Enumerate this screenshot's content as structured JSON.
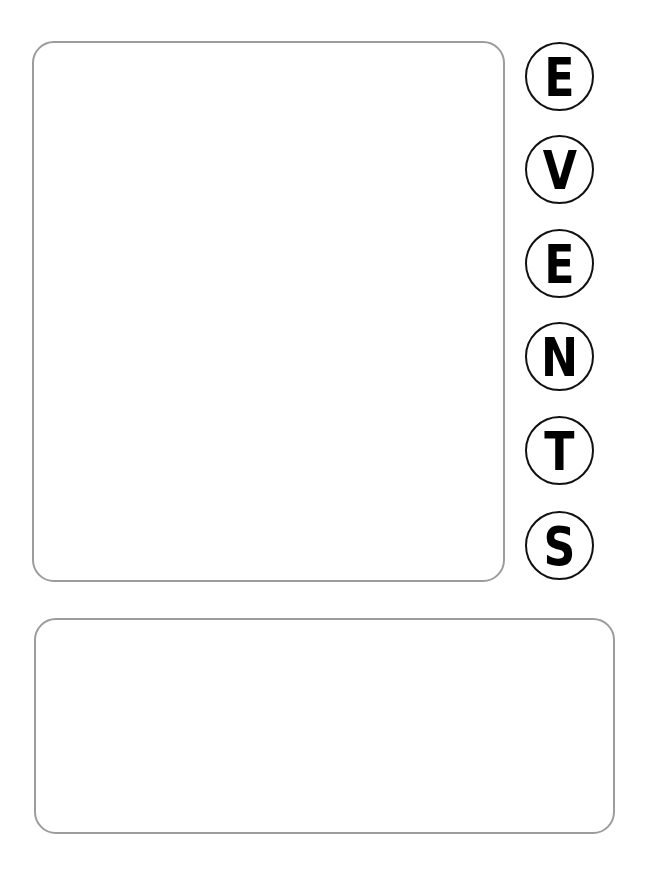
{
  "title_letters": [
    {
      "char": "E"
    },
    {
      "char": "V"
    },
    {
      "char": "E"
    },
    {
      "char": "N"
    },
    {
      "char": "T"
    },
    {
      "char": "S"
    }
  ],
  "title_word": "EVENTS",
  "panels": {
    "upper": {
      "content": ""
    },
    "lower": {
      "content": ""
    }
  },
  "colors": {
    "panel_border": "#9c9c9c",
    "circle_border": "#111111",
    "letter": "#000000",
    "background": "#ffffff"
  }
}
